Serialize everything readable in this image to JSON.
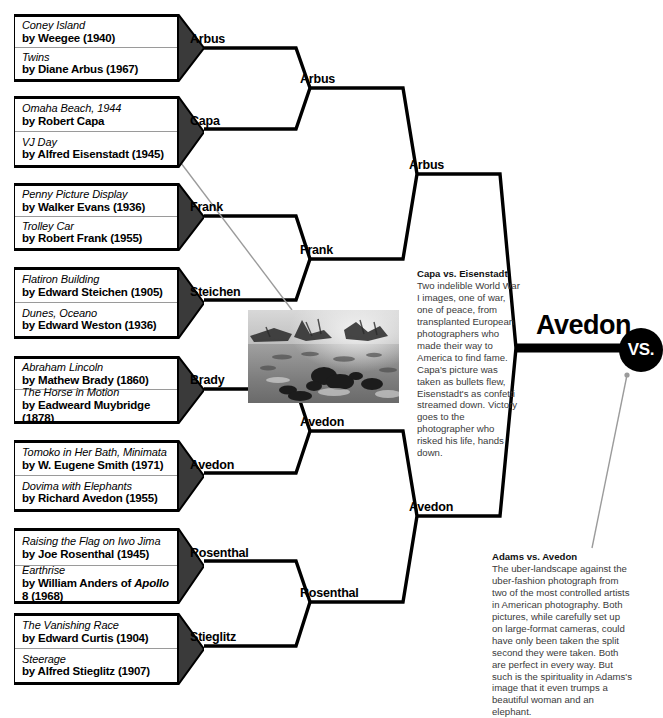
{
  "meta": {
    "vs_badge": "VS.",
    "accent_color": "#000000",
    "caption_color": "#3a3a3a",
    "divider_color": "#9a9a9a"
  },
  "round1": [
    {
      "id": "m1",
      "winner": "Arbus",
      "seeds": [
        {
          "title": "Coney Island",
          "by": "by Weegee (1940)"
        },
        {
          "title": "Twins",
          "by": "by Diane Arbus (1967)"
        }
      ]
    },
    {
      "id": "m2",
      "winner": "Capa",
      "seeds": [
        {
          "title": "Omaha Beach, 1944",
          "by": "by Robert Capa"
        },
        {
          "title": "VJ Day",
          "by": "by Alfred Eisenstadt (1945)"
        }
      ]
    },
    {
      "id": "m3",
      "winner": "Frank",
      "seeds": [
        {
          "title": "Penny Picture Display",
          "by": "by Walker Evans (1936)"
        },
        {
          "title": "Trolley Car",
          "by": "by Robert Frank (1955)"
        }
      ]
    },
    {
      "id": "m4",
      "winner": "Steichen",
      "seeds": [
        {
          "title": "Flatiron Building",
          "by": "by Edward Steichen (1905)"
        },
        {
          "title": "Dunes, Oceano",
          "by": "by Edward Weston (1936)"
        }
      ]
    },
    {
      "id": "m5",
      "winner": "Brady",
      "seeds": [
        {
          "title": "Abraham Lincoln",
          "by": "by Mathew Brady (1860)"
        },
        {
          "title": "The Horse in Motion",
          "by": "by Eadweard Muybridge (1878)"
        }
      ]
    },
    {
      "id": "m6",
      "winner": "Avedon",
      "seeds": [
        {
          "title": "Tomoko in Her Bath, Minimata",
          "by": "by W. Eugene Smith (1971)"
        },
        {
          "title": "Dovima with Elephants",
          "by": "by Richard Avedon (1955)"
        }
      ]
    },
    {
      "id": "m7",
      "winner": "Rosenthal",
      "seeds": [
        {
          "title": "Raising the Flag on Iwo Jima",
          "by": "by Joe Rosenthal (1945)"
        },
        {
          "title": "Earthrise",
          "by_pre": "by William Anders of ",
          "by_ital": "Apollo",
          "by_post": " 8 (1968)"
        }
      ]
    },
    {
      "id": "m8",
      "winner": "Stieglitz",
      "seeds": [
        {
          "title": "The Vanishing Race",
          "by": "by Edward Curtis (1904)"
        },
        {
          "title": "Steerage",
          "by": "by Alfred Stieglitz (1907)"
        }
      ]
    }
  ],
  "round2": [
    {
      "id": "q1",
      "winner": "Arbus"
    },
    {
      "id": "q2",
      "winner": "Frank"
    },
    {
      "id": "q3",
      "winner": "Avedon"
    },
    {
      "id": "q4",
      "winner": "Rosenthal"
    }
  ],
  "round3": [
    {
      "id": "s1",
      "winner": "Arbus"
    },
    {
      "id": "s2",
      "winner": "Avedon"
    }
  ],
  "final": {
    "id": "f1",
    "winner": "Avedon"
  },
  "photo": {
    "alt": "Omaha Beach, 1944 by Robert Capa",
    "caption_ref": "Capa vs. Eisenstadt"
  },
  "captions": [
    {
      "id": "capa",
      "heading": "Capa vs. Eisenstadt",
      "body": "Two indelible World War I images, one of war, one of peace, from transplanted European photographers who made their way to America to find fame. Capa's picture was taken as bullets flew, Eisenstadt's as confetti streamed down. Victory goes to the photographer who risked his life, hands down."
    },
    {
      "id": "adams",
      "heading": "Adams vs. Avedon",
      "body": "The uber-landscape against the uber-fashion photograph from two of the most controlled artists in American photography. Both pictures, while carefully set up on large-format cameras, could have only been taken the split second they were taken. Both are perfect in every way. But such is the spirituality in Adams's image that it even trumps a beautiful woman and an elephant."
    }
  ]
}
